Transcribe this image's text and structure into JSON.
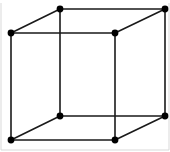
{
  "figure": {
    "name": "wireframe-cube",
    "type": "line-diagram",
    "title": "",
    "caption": "",
    "background_color": "#ffffff",
    "edge_color": "#1a1a1a",
    "vertex_color": "#000000",
    "frame_color": "#d9d9d9",
    "edge_width": 1.6,
    "vertex_radius": 3.4,
    "canvas": {
      "width": 170,
      "height": 152
    }
  },
  "geometry": {
    "vertices": [
      {
        "id": "front-top-left",
        "label": "A",
        "x": 11,
        "y": 33
      },
      {
        "id": "front-top-right",
        "label": "B",
        "x": 115,
        "y": 33
      },
      {
        "id": "front-bottom-right",
        "label": "C",
        "x": 115,
        "y": 140
      },
      {
        "id": "front-bottom-left",
        "label": "D",
        "x": 11,
        "y": 140
      },
      {
        "id": "back-top-left",
        "label": "E",
        "x": 60,
        "y": 9
      },
      {
        "id": "back-top-right",
        "label": "F",
        "x": 165,
        "y": 9
      },
      {
        "id": "back-bottom-right",
        "label": "G",
        "x": 165,
        "y": 116
      },
      {
        "id": "back-bottom-left",
        "label": "H",
        "x": 60,
        "y": 116
      }
    ],
    "edges": [
      {
        "id": "front-top",
        "from": "front-top-left",
        "to": "front-top-right",
        "x1": 11,
        "y1": 33,
        "x2": 115,
        "y2": 33
      },
      {
        "id": "front-right",
        "from": "front-top-right",
        "to": "front-bottom-right",
        "x1": 115,
        "y1": 33,
        "x2": 115,
        "y2": 140
      },
      {
        "id": "front-bottom",
        "from": "front-bottom-right",
        "to": "front-bottom-left",
        "x1": 115,
        "y1": 140,
        "x2": 11,
        "y2": 140
      },
      {
        "id": "front-left",
        "from": "front-bottom-left",
        "to": "front-top-left",
        "x1": 11,
        "y1": 140,
        "x2": 11,
        "y2": 33
      },
      {
        "id": "back-top",
        "from": "back-top-left",
        "to": "back-top-right",
        "x1": 60,
        "y1": 9,
        "x2": 165,
        "y2": 9
      },
      {
        "id": "back-right",
        "from": "back-top-right",
        "to": "back-bottom-right",
        "x1": 165,
        "y1": 9,
        "x2": 165,
        "y2": 116
      },
      {
        "id": "back-bottom",
        "from": "back-bottom-right",
        "to": "back-bottom-left",
        "x1": 165,
        "y1": 116,
        "x2": 60,
        "y2": 116
      },
      {
        "id": "back-left",
        "from": "back-bottom-left",
        "to": "back-top-left",
        "x1": 60,
        "y1": 116,
        "x2": 60,
        "y2": 9
      },
      {
        "id": "depth-top-left",
        "from": "front-top-left",
        "to": "back-top-left",
        "x1": 11,
        "y1": 33,
        "x2": 60,
        "y2": 9
      },
      {
        "id": "depth-top-right",
        "from": "front-top-right",
        "to": "back-top-right",
        "x1": 115,
        "y1": 33,
        "x2": 165,
        "y2": 9
      },
      {
        "id": "depth-bot-left",
        "from": "front-bottom-left",
        "to": "back-bottom-left",
        "x1": 11,
        "y1": 140,
        "x2": 60,
        "y2": 116
      },
      {
        "id": "depth-bot-right",
        "from": "front-bottom-right",
        "to": "back-bottom-right",
        "x1": 115,
        "y1": 140,
        "x2": 165,
        "y2": 116
      }
    ],
    "frame": {
      "visible": true,
      "lines": [
        {
          "id": "frame-left",
          "x1": 1,
          "y1": 3,
          "x2": 1,
          "y2": 150
        },
        {
          "id": "frame-bottom",
          "x1": 1,
          "y1": 150,
          "x2": 169,
          "y2": 150
        },
        {
          "id": "frame-right",
          "x1": 169,
          "y1": 3,
          "x2": 169,
          "y2": 150
        }
      ]
    }
  }
}
